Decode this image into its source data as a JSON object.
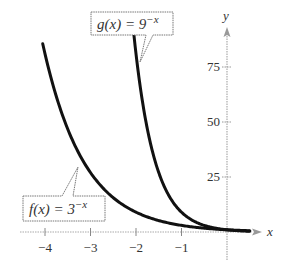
{
  "chart_data": {
    "type": "line",
    "title": "",
    "xlabel": "x",
    "ylabel": "y",
    "xlim": [
      -4.4,
      0.6
    ],
    "ylim": [
      -8,
      90
    ],
    "grid": false,
    "x_ticks": [
      -4,
      -3,
      -2,
      -1
    ],
    "x_tick_labels": [
      "−4",
      "−3",
      "−2",
      "−1"
    ],
    "y_ticks": [
      25,
      50,
      75
    ],
    "y_tick_labels": [
      "25",
      "50",
      "75"
    ],
    "series": [
      {
        "name": "f(x) = 3^-x",
        "label_base": "f(x) = 3",
        "label_exp": "−x",
        "base": 3,
        "x": [
          -4.05,
          -4,
          -3.5,
          -3,
          -2.5,
          -2,
          -1.5,
          -1,
          -0.5,
          0,
          0.5
        ],
        "values": [
          85.6,
          81,
          46.8,
          27,
          15.6,
          9,
          5.2,
          3,
          1.7,
          1,
          0.58
        ]
      },
      {
        "name": "g(x) = 9^-x",
        "label_base": "g(x) = 9",
        "label_exp": "−x",
        "base": 9,
        "x": [
          -2.05,
          -2,
          -1.75,
          -1.5,
          -1.25,
          -1,
          -0.75,
          -0.5,
          -0.25,
          0,
          0.5
        ],
        "values": [
          90.4,
          81,
          46.8,
          27,
          15.6,
          9,
          5.2,
          3,
          1.7,
          1,
          0.33
        ]
      }
    ],
    "annotations": [
      {
        "text": "g(x) = 9^-x",
        "points_to": "g curve near x = -1.9"
      },
      {
        "text": "f(x) = 3^-x",
        "points_to": "f curve near x = -3.2"
      }
    ]
  },
  "axes": {
    "x_label": "x",
    "y_label": "y"
  },
  "callouts": {
    "g": {
      "base": "g(x) = 9",
      "exp": "−x"
    },
    "f": {
      "base": "f(x) = 3",
      "exp": "−x"
    }
  },
  "colors": {
    "curve": "#111111",
    "axis": "#999999",
    "text": "#333333",
    "callout_border": "#777777"
  }
}
